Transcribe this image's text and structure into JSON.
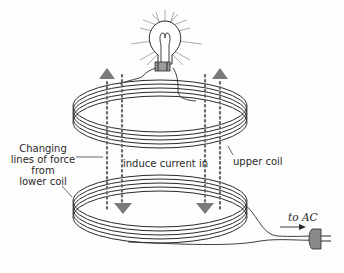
{
  "diagram": {
    "labels": {
      "changing_lines": [
        "Changing",
        "lines of force",
        "from",
        "lower coil"
      ],
      "induce_current": "induce current in",
      "upper_coil": "upper coil",
      "to_ac": "to AC"
    },
    "components": [
      "light-bulb",
      "upper-coil",
      "lower-coil",
      "ac-plug",
      "field-lines-up",
      "field-lines-down"
    ],
    "colors": {
      "ink": "#2a2a2a",
      "arrow_fill": "#7a7a7a",
      "field_dots": "#6a6a6a",
      "socket_fill": "#9a9a9a",
      "plug_fill": "#8a8a8a"
    }
  }
}
